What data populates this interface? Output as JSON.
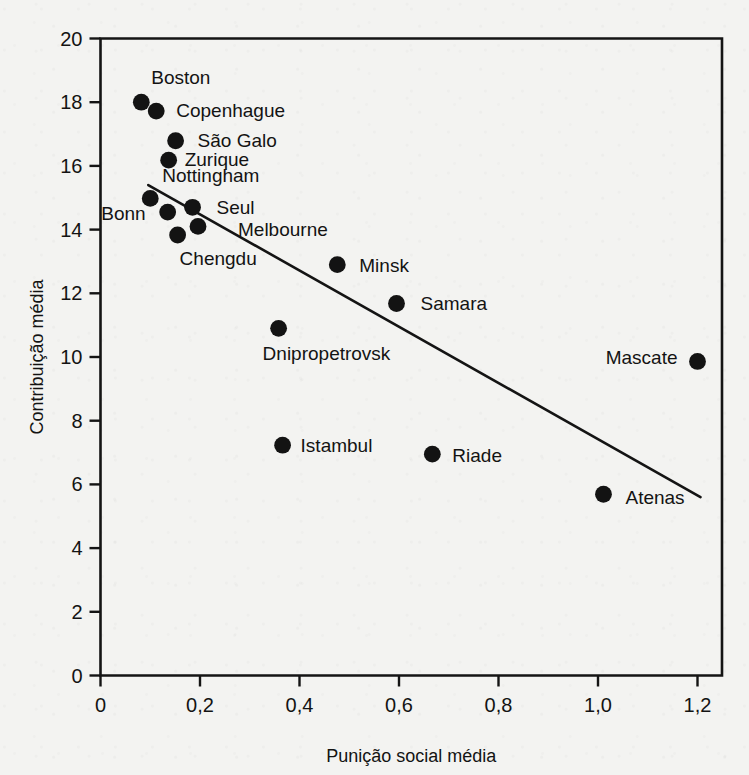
{
  "figure": {
    "background_color": "#f3f3f1",
    "ink_color": "#131313"
  },
  "chart_data": {
    "type": "scatter",
    "title": "",
    "xlabel": "Punição social média",
    "ylabel": "Contribuição média",
    "xlim": [
      0,
      1.26
    ],
    "ylim": [
      0,
      20
    ],
    "xticks": [
      0,
      0.2,
      0.4,
      0.6,
      0.8,
      1.0,
      1.2
    ],
    "xticklabels": [
      "0",
      "0,2",
      "0,4",
      "0,6",
      "0,8",
      "1,0",
      "1,2"
    ],
    "yticks": [
      0,
      2,
      4,
      6,
      8,
      10,
      12,
      14,
      16,
      18,
      20
    ],
    "yticklabels": [
      "0",
      "2",
      "4",
      "6",
      "8",
      "10",
      "12",
      "14",
      "16",
      "18",
      "20"
    ],
    "grid": false,
    "legend": false,
    "points": [
      {
        "label": "Boston",
        "x": 0.082,
        "y": 18.0,
        "label_dx": 10,
        "label_dy": -18,
        "label_anchor": "start"
      },
      {
        "label": "Copenhague",
        "x": 0.112,
        "y": 17.72,
        "label_dx": 20,
        "label_dy": 6,
        "label_anchor": "start"
      },
      {
        "label": "São Galo",
        "x": 0.151,
        "y": 16.79,
        "label_dx": 22,
        "label_dy": 6,
        "label_anchor": "start"
      },
      {
        "label": "Zurique",
        "x": 0.137,
        "y": 16.18,
        "label_dx": 16,
        "label_dy": 6,
        "label_anchor": "start"
      },
      {
        "label": "Nottingham",
        "x": 0.1,
        "y": 14.98,
        "label_dx": 12,
        "label_dy": -16,
        "label_anchor": "start"
      },
      {
        "label": "Bonn",
        "x": 0.135,
        "y": 14.55,
        "label_dx": -22,
        "label_dy": 8,
        "label_anchor": "end"
      },
      {
        "label": "Seul",
        "x": 0.185,
        "y": 14.7,
        "label_dx": 24,
        "label_dy": 7,
        "label_anchor": "start"
      },
      {
        "label": "Melbourne",
        "x": 0.196,
        "y": 14.1,
        "label_dx": 40,
        "label_dy": 10,
        "label_anchor": "start"
      },
      {
        "label": "Chengdu",
        "x": 0.155,
        "y": 13.83,
        "label_dx": 2,
        "label_dy": 30,
        "label_anchor": "start"
      },
      {
        "label": "Minsk",
        "x": 0.476,
        "y": 12.9,
        "label_dx": 22,
        "label_dy": 7,
        "label_anchor": "start"
      },
      {
        "label": "Samara",
        "x": 0.595,
        "y": 11.68,
        "label_dx": 24,
        "label_dy": 7,
        "label_anchor": "start"
      },
      {
        "label": "Dnipropetrovsk",
        "x": 0.358,
        "y": 10.9,
        "label_dx": -16,
        "label_dy": 32,
        "label_anchor": "start"
      },
      {
        "label": "Mascate",
        "x": 1.2,
        "y": 9.86,
        "label_dx": -20,
        "label_dy": 3,
        "label_anchor": "end"
      },
      {
        "label": "Istambul",
        "x": 0.366,
        "y": 7.23,
        "label_dx": 18,
        "label_dy": 7,
        "label_anchor": "start"
      },
      {
        "label": "Riade",
        "x": 0.667,
        "y": 6.95,
        "label_dx": 20,
        "label_dy": 8,
        "label_anchor": "start"
      },
      {
        "label": "Atenas",
        "x": 1.011,
        "y": 5.69,
        "label_dx": 22,
        "label_dy": 10,
        "label_anchor": "start"
      }
    ],
    "fit_line": {
      "x_start": 0.096,
      "y_start": 15.4,
      "x_end": 1.206,
      "y_end": 5.6
    }
  }
}
